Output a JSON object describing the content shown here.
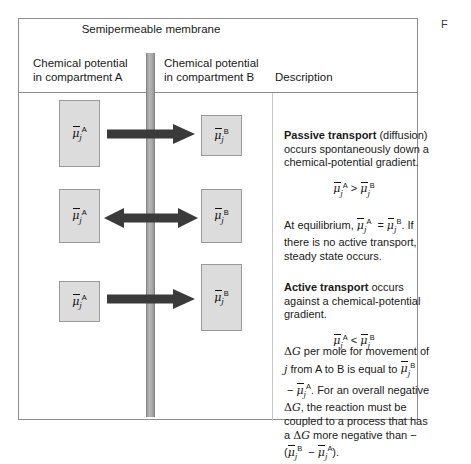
{
  "catchword": "F",
  "figure": {
    "membrane_label": "Semipermeable\nmembrane",
    "headers": {
      "compartment_a": "Chemical potential\nin compartment A",
      "compartment_b": "Chemical potential\nin compartment B",
      "description": "Description"
    }
  },
  "rows": [
    {
      "id": "passive-transport",
      "box_a_label": "μ̄j^A",
      "box_b_label": "μ̄j^B",
      "arrow": "right-arrow",
      "arrow_direction": "A to B",
      "relation": "greater-than",
      "description_bold": "Passive transport",
      "description_rest": " (diffusion) occurs spontaneously down a chemical-potential gradient.",
      "equation": "μ̄j^A  >  μ̄j^B"
    },
    {
      "id": "equilibrium",
      "box_a_label": "μ̄j^A",
      "box_b_label": "μ̄j^B",
      "arrow": "double-arrow",
      "arrow_direction": "both ways",
      "relation": "equals",
      "description_bold": "",
      "description_rest": "At equilibrium, μ̄j^A = μ̄j^B. If there is no active transport, steady state occurs.",
      "equation": ""
    },
    {
      "id": "active-transport",
      "box_a_label": "μ̄j^A",
      "box_b_label": "μ̄j^B",
      "arrow": "right-arrow",
      "arrow_direction": "A to B",
      "relation": "less-than",
      "description_bold": "Active transport",
      "description_rest": " occurs against a chemical-potential gradient.",
      "equation": "μ̄j^A  <  μ̄j^B"
    }
  ],
  "free_energy_note": {
    "text": "ΔG per mole for movement of j from A to B is equal to μ̄j^B − μ̄j^A. For an overall negative ΔG, the reaction must be coupled to a process that has a ΔG more negative than −(μ̄j^B − μ̄j^A)."
  },
  "colors": {
    "box_fill": "#dcdcdc",
    "box_border": "#9a9a9a",
    "membrane": "#a8a8a8",
    "arrow": "#3a3a3a",
    "frame": "#8d8d8d",
    "text": "#1a1a1a"
  }
}
